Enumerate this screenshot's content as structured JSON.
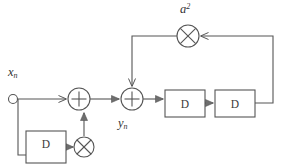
{
  "diagram": {
    "stroke_color": "#555555",
    "fill_color": "#ffffff",
    "background": "#ffffff",
    "nodes": {
      "input_node": {
        "label_base": "x",
        "label_sub": "n",
        "shape": "open-circle",
        "cx": 13,
        "cy": 99,
        "r": 4.5
      },
      "adder_1": {
        "symbol": "+",
        "shape": "circle-plus",
        "cx": 79,
        "cy": 99,
        "r": 11
      },
      "adder_2": {
        "symbol": "+",
        "shape": "circle-plus",
        "cx": 132,
        "cy": 99,
        "r": 11,
        "label_base": "y",
        "label_sub": "n"
      },
      "multiplier_feedback_lower": {
        "symbol": "x",
        "shape": "circle-times",
        "cx": 84,
        "cy": 146,
        "r": 10
      },
      "multiplier_feedback_upper": {
        "symbol": "x",
        "shape": "circle-times",
        "cx": 188,
        "cy": 36,
        "r": 11,
        "label_base": "a",
        "label_sup": "2"
      }
    },
    "blocks": [
      {
        "name": "delay-block-lower",
        "label": "D",
        "x": 26,
        "y": 131,
        "w": 40,
        "h": 32
      },
      {
        "name": "delay-block-1",
        "label": "D",
        "x": 165,
        "y": 90,
        "w": 40,
        "h": 27
      },
      {
        "name": "delay-block-2",
        "label": "D",
        "x": 215,
        "y": 90,
        "w": 40,
        "h": 27
      }
    ],
    "labels": {
      "input_signal": "x",
      "input_signal_sub": "n",
      "output_signal": "y",
      "output_signal_sub": "n",
      "coefficient": "a",
      "coefficient_sup": "2",
      "delay_symbol": "D",
      "adder_symbol": "+",
      "multiplier_symbol": "×"
    }
  }
}
